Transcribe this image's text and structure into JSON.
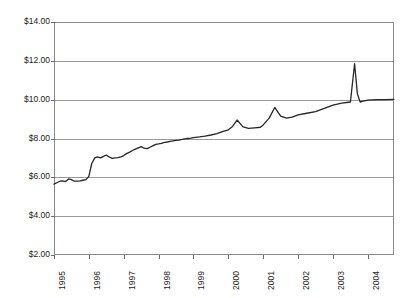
{
  "chart_data": {
    "type": "line",
    "title": "",
    "xlabel": "",
    "ylabel": "",
    "ylim": [
      2,
      14
    ],
    "ytick_labels": [
      "$14.00",
      "$12.00",
      "$10.00",
      "$8.00",
      "$6.00",
      "$4.00",
      "$2.00"
    ],
    "ytick_values": [
      14,
      12,
      10,
      8,
      6,
      4,
      2
    ],
    "ytick_prefix": "$",
    "grid": true,
    "grid_axis": "y",
    "legend": false,
    "legend_position": "none",
    "xlim": [
      1995,
      2004.75
    ],
    "categories": [
      "1995",
      "1996",
      "1997",
      "1998",
      "1999",
      "2000",
      "2001",
      "2002",
      "2003",
      "2004"
    ],
    "xtick_values": [
      1995,
      1996,
      1997,
      1998,
      1999,
      2000,
      2001,
      2002,
      2003,
      2004
    ],
    "xtick_rotation": -90,
    "series": [
      {
        "name": "price",
        "color": "#262626",
        "x": [
          1995.0,
          1995.08,
          1995.17,
          1995.25,
          1995.33,
          1995.42,
          1995.5,
          1995.58,
          1995.67,
          1995.75,
          1995.83,
          1995.92,
          1996.0,
          1996.08,
          1996.17,
          1996.25,
          1996.33,
          1996.42,
          1996.5,
          1996.58,
          1996.67,
          1996.75,
          1996.83,
          1996.92,
          1997.0,
          1997.08,
          1997.17,
          1997.25,
          1997.33,
          1997.42,
          1997.5,
          1997.58,
          1997.67,
          1997.75,
          1997.83,
          1997.92,
          1998.0,
          1998.08,
          1998.17,
          1998.25,
          1998.33,
          1998.42,
          1998.5,
          1998.58,
          1998.67,
          1998.75,
          1998.83,
          1998.92,
          1999.0,
          1999.17,
          1999.33,
          1999.5,
          1999.67,
          1999.83,
          2000.0,
          2000.12,
          2000.25,
          2000.42,
          2000.58,
          2000.75,
          2000.92,
          2001.0,
          2001.17,
          2001.33,
          2001.5,
          2001.67,
          2001.83,
          2002.0,
          2002.25,
          2002.5,
          2002.75,
          2003.0,
          2003.25,
          2003.5,
          2003.62,
          2003.7,
          2003.78,
          2003.86,
          2004.0,
          2004.25,
          2004.5,
          2004.75
        ],
        "values": [
          5.65,
          5.72,
          5.8,
          5.82,
          5.78,
          5.92,
          5.88,
          5.8,
          5.8,
          5.82,
          5.85,
          5.88,
          6.05,
          6.7,
          7.0,
          7.05,
          7.0,
          7.08,
          7.15,
          7.05,
          6.98,
          7.0,
          7.02,
          7.05,
          7.12,
          7.22,
          7.3,
          7.38,
          7.45,
          7.52,
          7.58,
          7.5,
          7.48,
          7.55,
          7.62,
          7.7,
          7.72,
          7.75,
          7.8,
          7.82,
          7.85,
          7.88,
          7.9,
          7.92,
          7.95,
          7.98,
          8.0,
          8.02,
          8.05,
          8.08,
          8.12,
          8.18,
          8.25,
          8.35,
          8.45,
          8.62,
          8.95,
          8.6,
          8.52,
          8.55,
          8.58,
          8.7,
          9.05,
          9.6,
          9.15,
          9.05,
          9.1,
          9.22,
          9.3,
          9.38,
          9.55,
          9.72,
          9.82,
          9.88,
          11.85,
          10.3,
          9.88,
          9.92,
          9.98,
          10.0,
          10.0,
          10.02
        ]
      }
    ],
    "annotations": [
      {
        "label": "spike-peak",
        "x": 2003.62,
        "y": 11.85
      }
    ]
  }
}
